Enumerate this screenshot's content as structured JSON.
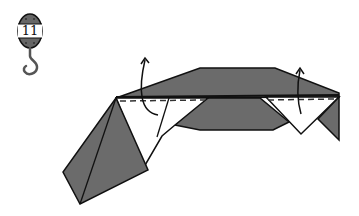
{
  "diagram": {
    "type": "origami-fold-instruction",
    "step_number": "11",
    "step_badge_icon": "hook-weight-icon",
    "fold_lines": [
      {
        "name": "valley-fold-left",
        "style": "dashed"
      },
      {
        "name": "valley-fold-right",
        "style": "dashed"
      }
    ],
    "arrows": [
      {
        "name": "fold-up-arrow-left",
        "direction": "up"
      },
      {
        "name": "fold-up-arrow-right",
        "direction": "up"
      }
    ],
    "colors": {
      "paper_colored": "#6b6b6b",
      "paper_white": "#ffffff",
      "line": "#111111"
    }
  }
}
